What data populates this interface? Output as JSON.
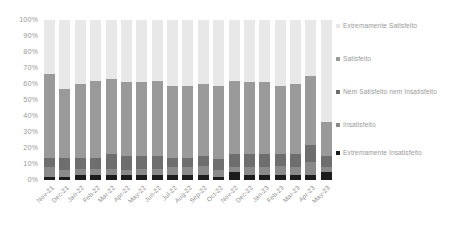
{
  "chart_data": {
    "type": "bar",
    "subtype": "stacked-100-percent",
    "title": "",
    "xlabel": "",
    "ylabel": "",
    "ylim": [
      0,
      100
    ],
    "ytick_labels": [
      "100%",
      "90%",
      "80%",
      "70%",
      "60%",
      "50%",
      "40%",
      "30%",
      "20%",
      "10%",
      "0%"
    ],
    "ytick_values": [
      100,
      90,
      80,
      70,
      60,
      50,
      40,
      30,
      20,
      10,
      0
    ],
    "grid": false,
    "legend_position": "right",
    "categories": [
      "Nov-21",
      "Dec-21",
      "Jan-22",
      "Feb-22",
      "Mar-22",
      "Apr-22",
      "May-22",
      "Jun-22",
      "Jul-22",
      "Aug-22",
      "Sep-22",
      "Oct-22",
      "Nov-22",
      "Dec-22",
      "Jan-23",
      "Feb-23",
      "Mar-23",
      "Apr-23",
      "May-23"
    ],
    "stack_order_bottom_to_top": [
      "Extremamente Insatisfeito",
      "Insatisfeito",
      "Nem Satisfeito nem Insatisfeito",
      "Satisfeito",
      "Extremamente Satisfeito"
    ],
    "series": [
      {
        "name": "Extremamente Satisfeito",
        "color": "#e8e8e8",
        "values": [
          34,
          43,
          40,
          38,
          37,
          39,
          39,
          38,
          41,
          41,
          40,
          41,
          38,
          39,
          39,
          41,
          40,
          35,
          64
        ]
      },
      {
        "name": "Satisfeito",
        "color": "#9a9a9a",
        "values": [
          52,
          43,
          46,
          48,
          47,
          46,
          46,
          47,
          45,
          45,
          45,
          46,
          46,
          45,
          45,
          43,
          44,
          43,
          21
        ]
      },
      {
        "name": "Nem Satisfeito nem Insatisfeito",
        "color": "#6e6e6e",
        "values": [
          6,
          8,
          7,
          7,
          9,
          9,
          8,
          8,
          6,
          6,
          6,
          7,
          8,
          8,
          8,
          7,
          8,
          11,
          7
        ]
      },
      {
        "name": "Insatisfeito",
        "color": "#8a8a8a",
        "values": [
          6,
          4,
          4,
          4,
          4,
          3,
          4,
          4,
          5,
          5,
          6,
          4,
          3,
          5,
          5,
          6,
          5,
          8,
          3
        ]
      },
      {
        "name": "Extremamente Insatisfeito",
        "color": "#1c1c1c",
        "values": [
          2,
          2,
          3,
          3,
          3,
          3,
          3,
          3,
          3,
          3,
          3,
          2,
          5,
          3,
          3,
          3,
          3,
          3,
          5
        ]
      }
    ],
    "legend": [
      {
        "label": "Extremamente Satisfeito",
        "color": "#e8e8e8"
      },
      {
        "label": "Satisfeito",
        "color": "#9a9a9a"
      },
      {
        "label": "Nem Satisfeito nem Insatisfeito",
        "color": "#6e6e6e"
      },
      {
        "label": "Insatisfeito",
        "color": "#8a8a8a"
      },
      {
        "label": "Extremamente Insatisfeito",
        "color": "#1c1c1c"
      }
    ],
    "colors": {
      "axis_text": "#9a9a9a",
      "background": "#ffffff"
    }
  }
}
